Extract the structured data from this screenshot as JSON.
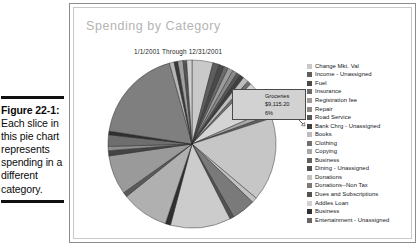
{
  "figure": {
    "number_label": "Figure 22-1:",
    "body_text": "Each slice in this pie chart represents spending in a different category."
  },
  "report": {
    "title": "Spending by Category",
    "date_range": "1/1/2001 Through 12/31/2001",
    "title_color": "#b4b4b4"
  },
  "callout": {
    "category": "Groceries",
    "amount": "$9,115.20",
    "percent": "6%"
  },
  "legend": {
    "items": [
      {
        "label": "Change Mkt. Val",
        "color": "#c9c9c9"
      },
      {
        "label": "Income - Unassigned",
        "color": "#5e5e5e"
      },
      {
        "label": "Fuel",
        "color": "#4a4a4a"
      },
      {
        "label": "Insurance",
        "color": "#6b6b6b"
      },
      {
        "label": "Registration fee",
        "color": "#9c9c9c"
      },
      {
        "label": "Repair",
        "color": "#8a8a8a"
      },
      {
        "label": "Road Service",
        "color": "#565656"
      },
      {
        "label": "Bank Chrg - Unassigned",
        "color": "#3f3f3f"
      },
      {
        "label": "Books",
        "color": "#bdbdbd"
      },
      {
        "label": "Clothing",
        "color": "#707070"
      },
      {
        "label": "Copying",
        "color": "#a8a8a8"
      },
      {
        "label": "Business",
        "color": "#616161"
      },
      {
        "label": "Dining - Unassigned",
        "color": "#4d4d4d"
      },
      {
        "label": "Donations",
        "color": "#c2c2c2"
      },
      {
        "label": "Donations--Non Tax",
        "color": "#7a7a7a"
      },
      {
        "label": "Dues and Subscriptions",
        "color": "#525252"
      },
      {
        "label": "Addles Loan",
        "color": "#d0d0d0"
      },
      {
        "label": "Business",
        "color": "#2f2f2f"
      },
      {
        "label": "Entertainment - Unassigned",
        "color": "#666666"
      }
    ]
  },
  "chart_data": {
    "type": "pie",
    "title": "Spending by Category",
    "subtitle": "1/1/2001 Through 12/31/2001",
    "legend_position": "right",
    "annotations": [
      {
        "label": "Groceries",
        "value": "$9,115.20",
        "percent": "6%"
      }
    ],
    "categories": [
      "Change Mkt. Val",
      "Income - Unassigned",
      "Fuel",
      "Insurance",
      "Registration fee",
      "Repair",
      "Road Service",
      "Bank Chrg - Unassigned",
      "Books",
      "Clothing",
      "Copying",
      "Business",
      "Dining - Unassigned",
      "Donations",
      "Donations--Non Tax",
      "Dues and Subscriptions",
      "Addles Loan",
      "Business",
      "Entertainment - Unassigned"
    ],
    "slices": [
      {
        "label": "Change Mkt. Val",
        "percent": 4.0,
        "color": "#c9c9c9"
      },
      {
        "label": "Income - Unassigned",
        "percent": 1.2,
        "color": "#5e5e5e"
      },
      {
        "label": "Fuel",
        "percent": 1.0,
        "color": "#4a4a4a"
      },
      {
        "label": "Insurance",
        "percent": 0.8,
        "color": "#6b6b6b"
      },
      {
        "label": "Registration fee",
        "percent": 1.0,
        "color": "#9c9c9c"
      },
      {
        "label": "Repair",
        "percent": 0.9,
        "color": "#8a8a8a"
      },
      {
        "label": "Road Service",
        "percent": 0.7,
        "color": "#565656"
      },
      {
        "label": "Bank Chrg - Unassigned",
        "percent": 0.8,
        "color": "#3f3f3f"
      },
      {
        "label": "Books",
        "percent": 1.1,
        "color": "#bdbdbd"
      },
      {
        "label": "Clothing",
        "percent": 0.7,
        "color": "#707070"
      },
      {
        "label": "Groceries",
        "percent": 6.0,
        "color": "#d4d4d4"
      },
      {
        "label": "Copying",
        "percent": 1.0,
        "color": "#a8a8a8"
      },
      {
        "label": "Business",
        "percent": 0.6,
        "color": "#616161"
      },
      {
        "label": "Dining - Unassigned",
        "percent": 16.0,
        "color": "#c6c6c6"
      },
      {
        "label": "Donations",
        "percent": 1.0,
        "color": "#c2c2c2"
      },
      {
        "label": "Donations--Non Tax",
        "percent": 4.5,
        "color": "#7a7a7a"
      },
      {
        "label": "Dues and Subscriptions",
        "percent": 0.8,
        "color": "#525252"
      },
      {
        "label": "Addles Loan",
        "percent": 11.5,
        "color": "#cccccc"
      },
      {
        "label": "Business",
        "percent": 1.0,
        "color": "#2f2f2f"
      },
      {
        "label": "Entertainment - Unassigned",
        "percent": 9.0,
        "color": "#b0b0b0"
      },
      {
        "label": "Misc A",
        "percent": 0.9,
        "color": "#5a5a5a"
      },
      {
        "label": "Misc B",
        "percent": 7.5,
        "color": "#9a9a9a"
      },
      {
        "label": "Misc C",
        "percent": 1.0,
        "color": "#444444"
      },
      {
        "label": "Misc D",
        "percent": 0.8,
        "color": "#8e8e8e"
      },
      {
        "label": "Misc E",
        "percent": 2.2,
        "color": "#6e6e6e"
      },
      {
        "label": "Misc F",
        "percent": 0.7,
        "color": "#303030"
      },
      {
        "label": "Misc G",
        "percent": 18.0,
        "color": "#7f7f7f"
      },
      {
        "label": "Misc H",
        "percent": 0.9,
        "color": "#b6b6b6"
      },
      {
        "label": "Misc I",
        "percent": 0.7,
        "color": "#3a3a3a"
      },
      {
        "label": "Misc J",
        "percent": 1.0,
        "color": "#a0a0a0"
      },
      {
        "label": "Misc K",
        "percent": 0.7,
        "color": "#555555"
      },
      {
        "label": "Misc L",
        "percent": 1.0,
        "color": "#cfcfcf"
      }
    ]
  }
}
